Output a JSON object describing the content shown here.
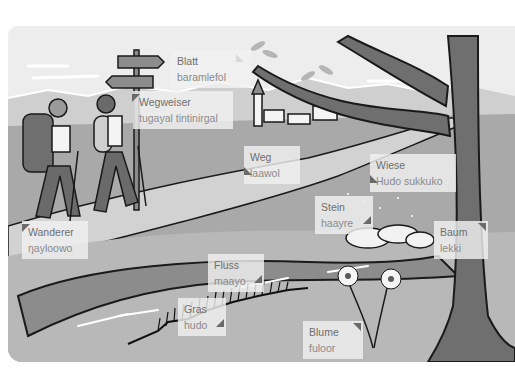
{
  "illustration": {
    "description": "Hiking landscape vocabulary illustration",
    "colors": {
      "sky": "#ededed",
      "mountains": "#cfcfcf",
      "meadow": "#a9a9a9",
      "path": "#d8d8d8",
      "river": "#8c8c8c",
      "tree": "#6f6f6f",
      "outline": "#1a1a1a",
      "label_bg": "#f0f0f0",
      "label_text_primary": "#6e6e6e",
      "label_text_secondary": "#8a8a8a",
      "pointer": "#6a6a6a"
    }
  },
  "labels": [
    {
      "id": "blatt",
      "term": "Blatt",
      "translation": "baramlefol"
    },
    {
      "id": "wegweiser",
      "term": "Wegweiser",
      "translation": "tugayal tintinirgal"
    },
    {
      "id": "weg",
      "term": "Weg",
      "translation": "laawol"
    },
    {
      "id": "wiese",
      "term": "Wiese",
      "translation": "Hudo sukkuko"
    },
    {
      "id": "wanderer",
      "term": "Wanderer",
      "translation": "ŋayloowo"
    },
    {
      "id": "stein",
      "term": "Stein",
      "translation": "haayre"
    },
    {
      "id": "baum",
      "term": "Baum",
      "translation": "lekki"
    },
    {
      "id": "fluss",
      "term": "Fluss",
      "translation": "maayo"
    },
    {
      "id": "gras",
      "term": "Gras",
      "translation": "hudo"
    },
    {
      "id": "blume",
      "term": "Blume",
      "translation": "fuloor"
    }
  ]
}
